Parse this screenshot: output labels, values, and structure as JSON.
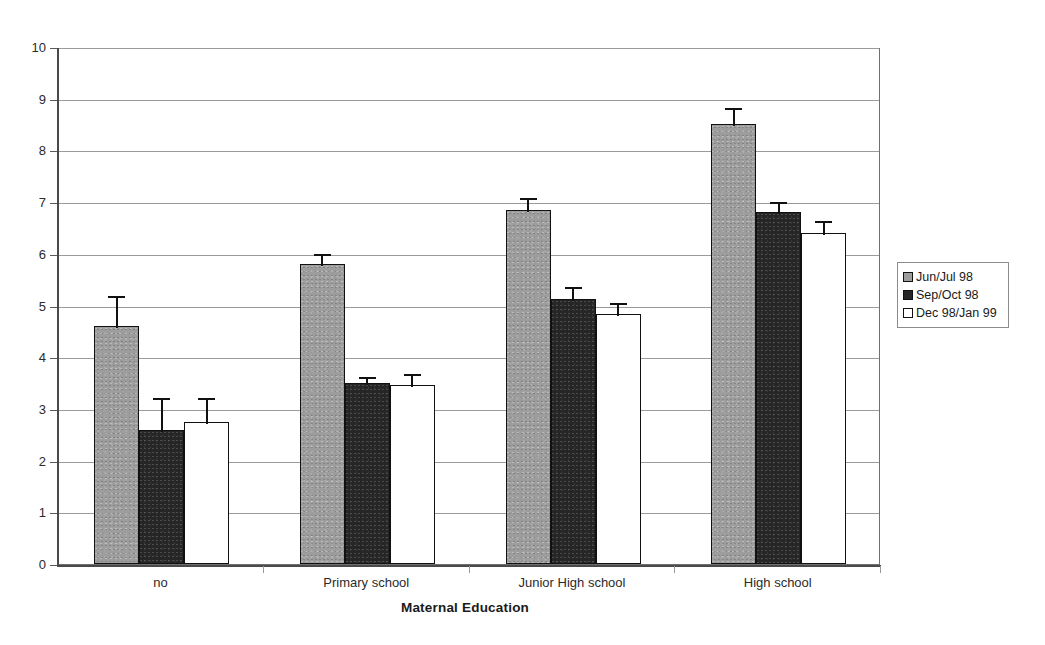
{
  "chart_data": {
    "type": "bar",
    "title": "",
    "xlabel": "Maternal Education",
    "ylabel": "",
    "ylim": [
      0,
      10
    ],
    "ytick_labels": [
      "10",
      "9",
      "8",
      "7",
      "6",
      "5",
      "4",
      "3",
      "2",
      "1",
      "0"
    ],
    "yticks": [
      10,
      9,
      8,
      7,
      6,
      5,
      4,
      3,
      2,
      1,
      0
    ],
    "grid": true,
    "legend_position": "right",
    "categories": [
      "no",
      "Primary school",
      "Junior High school",
      "High school"
    ],
    "series": [
      {
        "name": "Jun/Jul 98",
        "color": "#9d9d9d",
        "values": [
          4.6,
          5.8,
          6.85,
          8.52
        ],
        "errors": [
          0.62,
          0.24,
          0.26,
          0.33
        ]
      },
      {
        "name": "Sep/Oct 98",
        "color": "#262626",
        "values": [
          2.6,
          3.5,
          5.12,
          6.8
        ],
        "errors": [
          0.65,
          0.16,
          0.28,
          0.25
        ]
      },
      {
        "name": "Dec 98/Jan 99",
        "color": "#ffffff",
        "values": [
          2.75,
          3.47,
          4.83,
          6.4
        ],
        "errors": [
          0.5,
          0.25,
          0.25,
          0.28
        ]
      }
    ]
  },
  "legend": {
    "items": [
      {
        "label": "Jun/Jul 98"
      },
      {
        "label": "Sep/Oct 98"
      },
      {
        "label": "Dec 98/Jan 99"
      }
    ]
  },
  "axis": {
    "x_title": "Maternal Education"
  }
}
